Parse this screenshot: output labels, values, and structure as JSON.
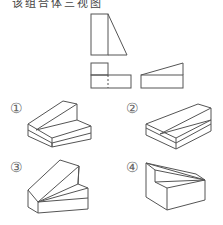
{
  "header": {
    "cut_off_text": "该组合体三视图"
  },
  "three_views": {
    "front_view": "right trapezoid split: rectangle + right triangle",
    "top_view": "L-shape with dashed vertical line",
    "side_view": "rectangle with sloped top triangle"
  },
  "options": [
    {
      "label": "①",
      "description": "stepped block with triangular slanted faces"
    },
    {
      "label": "②",
      "description": "wedge slab with diagonal crease"
    },
    {
      "label": "③",
      "description": "block with tall slanted prism on left"
    },
    {
      "label": "④",
      "description": "block with sloping triangular top surfaces"
    }
  ]
}
